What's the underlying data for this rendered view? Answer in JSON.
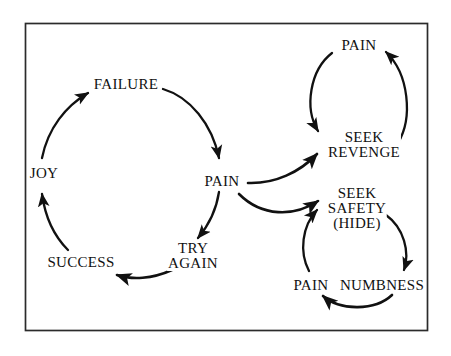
{
  "diagram": {
    "border_color": "#2b2b2b",
    "ink_color": "#111111",
    "background_color": "#ffffff",
    "nodes": {
      "joy": {
        "label": "JOY"
      },
      "failure": {
        "label": "FAILURE"
      },
      "pain_center": {
        "label": "PAIN"
      },
      "try_again": {
        "line1": "TRY",
        "line2": "AGAIN"
      },
      "success": {
        "label": "SUCCESS"
      },
      "pain_top_right": {
        "label": "PAIN"
      },
      "seek_revenge": {
        "line1": "SEEK",
        "line2": "REVENGE"
      },
      "seek_safety": {
        "line1": "SEEK",
        "line2": "SAFETY",
        "line3": "(HIDE)"
      },
      "pain_bottom_right": {
        "label": "PAIN"
      },
      "numbness": {
        "label": "NUMBNESS"
      }
    },
    "edges": [
      {
        "from": "joy",
        "to": "failure"
      },
      {
        "from": "failure",
        "to": "pain_center"
      },
      {
        "from": "pain_center",
        "to": "try_again"
      },
      {
        "from": "try_again",
        "to": "success"
      },
      {
        "from": "success",
        "to": "joy"
      },
      {
        "from": "pain_center",
        "to": "seek_revenge"
      },
      {
        "from": "pain_center",
        "to": "seek_safety"
      },
      {
        "from": "pain_top_right",
        "to": "seek_revenge"
      },
      {
        "from": "seek_revenge",
        "to": "pain_top_right"
      },
      {
        "from": "seek_safety",
        "to": "numbness"
      },
      {
        "from": "numbness",
        "to": "pain_bottom_right"
      },
      {
        "from": "pain_bottom_right",
        "to": "seek_safety"
      }
    ]
  }
}
